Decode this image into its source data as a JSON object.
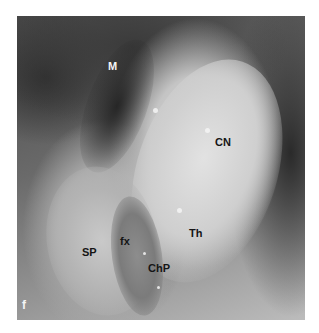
{
  "figure": {
    "panel_letter": "f",
    "labels": {
      "m": "M",
      "cn": "CN",
      "sp": "SP",
      "fx": "fx",
      "chp": "ChP",
      "th": "Th"
    }
  }
}
